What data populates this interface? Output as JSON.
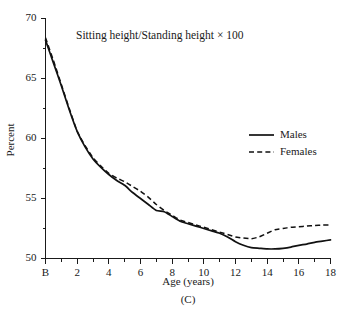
{
  "chart_data": {
    "type": "line",
    "title": "Sitting height/Standing height × 100",
    "panel_label": "(C)",
    "xlabel": "Age (years)",
    "ylabel": "Percent",
    "xlim": [
      0,
      18
    ],
    "ylim": [
      50,
      70
    ],
    "grid": false,
    "legend_position": "right-middle",
    "x_tick_labels": [
      "B",
      "2",
      "4",
      "6",
      "8",
      "10",
      "12",
      "14",
      "16",
      "18"
    ],
    "x_tick_values": [
      0,
      2,
      4,
      6,
      8,
      10,
      12,
      14,
      16,
      18
    ],
    "x_minor_tick_values": [
      1,
      3,
      5,
      7,
      9,
      11,
      13,
      15,
      17
    ],
    "y_tick_labels": [
      "50",
      "55",
      "60",
      "65",
      "70"
    ],
    "y_tick_values": [
      50,
      55,
      60,
      65,
      70
    ],
    "y_minor_tick_values": [
      52.5,
      57.5,
      62.5,
      67.5
    ],
    "x": [
      0,
      0.5,
      1,
      1.5,
      2,
      2.5,
      3,
      3.5,
      4,
      4.5,
      5,
      5.5,
      6,
      6.5,
      7,
      7.5,
      8,
      8.5,
      9,
      9.5,
      10,
      10.5,
      11,
      11.5,
      12,
      12.5,
      13,
      13.5,
      14,
      14.5,
      15,
      15.5,
      16,
      16.5,
      17,
      17.5,
      18
    ],
    "series": [
      {
        "name": "Males",
        "style": "solid",
        "color": "#111111",
        "values": [
          68.2,
          66.3,
          64.4,
          62.4,
          60.6,
          59.3,
          58.3,
          57.6,
          57.0,
          56.5,
          56.1,
          55.5,
          55.0,
          54.5,
          54.0,
          53.9,
          53.5,
          53.1,
          52.9,
          52.7,
          52.5,
          52.3,
          52.1,
          51.8,
          51.4,
          51.1,
          50.9,
          50.85,
          50.8,
          50.8,
          50.85,
          50.95,
          51.1,
          51.2,
          51.35,
          51.45,
          51.55
        ]
      },
      {
        "name": "Females",
        "style": "dashed",
        "color": "#111111",
        "values": [
          68.4,
          66.5,
          64.5,
          62.5,
          60.6,
          59.4,
          58.4,
          57.7,
          57.1,
          56.7,
          56.4,
          56.0,
          55.6,
          55.1,
          54.5,
          54.0,
          53.6,
          53.2,
          53.0,
          52.8,
          52.6,
          52.4,
          52.2,
          52.0,
          51.8,
          51.7,
          51.65,
          51.8,
          52.1,
          52.4,
          52.5,
          52.6,
          52.65,
          52.7,
          52.75,
          52.78,
          52.8
        ]
      }
    ],
    "legend": [
      {
        "label": "Males",
        "style": "solid"
      },
      {
        "label": "Females",
        "style": "dashed"
      }
    ]
  }
}
